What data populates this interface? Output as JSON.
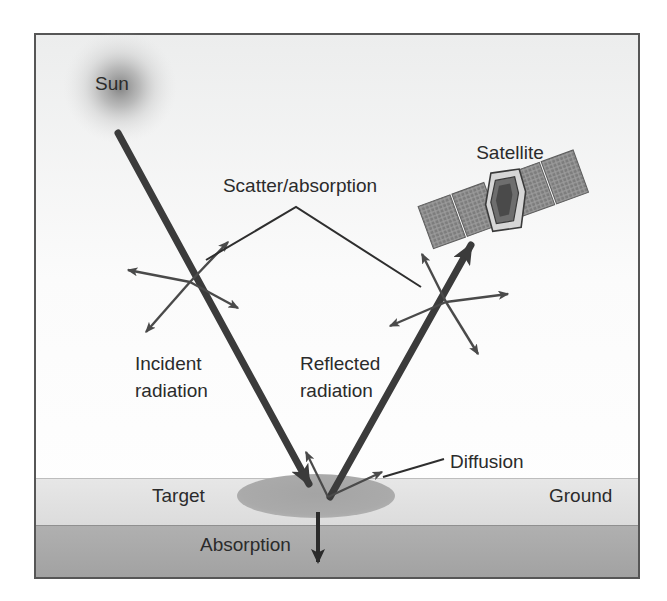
{
  "figure": {
    "type": "remote-sensing-radiation-path-diagram",
    "title_visible": false,
    "frame": {
      "x": 34,
      "y": 33,
      "width": 606,
      "height": 546,
      "border_color": "#555555",
      "border_width": 2
    },
    "background_color": "#f2f2f2",
    "sky_color": "#fbfbfb",
    "outer_page_color": "#ffffff"
  },
  "colors": {
    "ray_stroke": "#3b3b3b",
    "thin_arrow_stroke": "#4a4a4a",
    "leader_line": "#2e2e2e",
    "text": "#2b2b2b",
    "sun_glow": "#8c8c8c",
    "ground_surface_band": "#e2e2e2",
    "ground_subsurface_band": "#a9a9a9",
    "target_ellipse": "#a8a8a8",
    "satellite_panel": "#9a9a9a",
    "satellite_panel_dark": "#6f6f6f",
    "satellite_body": "#d8d8d8",
    "satellite_body_shadow": "#4f4f4f"
  },
  "labels": {
    "sun": {
      "text": "Sun",
      "x": 95,
      "y": 90,
      "font_size": 19,
      "anchor": "start"
    },
    "satellite": {
      "text": "Satellite",
      "x": 510,
      "y": 159,
      "font_size": 19,
      "anchor": "middle"
    },
    "scatter_absorption": {
      "text": "Scatter/absorption",
      "x": 300,
      "y": 192,
      "font_size": 19,
      "anchor": "middle"
    },
    "incident_radiation": {
      "lines": [
        "Incident",
        "radiation"
      ],
      "x": 135,
      "y": 370,
      "line_height": 27,
      "font_size": 19,
      "anchor": "start"
    },
    "reflected_radiation": {
      "lines": [
        "Reflected",
        "radiation"
      ],
      "x": 300,
      "y": 370,
      "line_height": 27,
      "font_size": 19,
      "anchor": "start"
    },
    "diffusion": {
      "text": "Diffusion",
      "x": 450,
      "y": 468,
      "font_size": 19,
      "anchor": "start"
    },
    "target": {
      "text": "Target",
      "x": 152,
      "y": 502,
      "font_size": 19,
      "anchor": "start"
    },
    "ground": {
      "text": "Ground",
      "x": 549,
      "y": 502,
      "font_size": 19,
      "anchor": "start"
    },
    "absorption": {
      "text": "Absorption",
      "x": 200,
      "y": 551,
      "font_size": 19,
      "anchor": "start"
    }
  },
  "geometry": {
    "sun_glow": {
      "cx": 120,
      "cy": 87,
      "r": 57
    },
    "ground_surface_band": {
      "x": 36,
      "y": 478,
      "width": 602,
      "height": 47
    },
    "ground_subsurface_band": {
      "x": 36,
      "y": 525,
      "width": 602,
      "height": 52
    },
    "target_ellipse": {
      "cx": 316,
      "cy": 496,
      "rx": 79,
      "ry": 22
    },
    "incident_ray": {
      "x1": 118,
      "y1": 133,
      "x2": 314,
      "y2": 492,
      "width": 7
    },
    "reflected_ray": {
      "x1": 330,
      "y1": 497,
      "x2": 478,
      "y2": 232,
      "width": 7
    },
    "absorption_arrow": {
      "x1": 318,
      "y1": 512,
      "x2": 318,
      "y2": 570,
      "width": 4
    },
    "scatter_point_left": {
      "x": 190,
      "y": 282
    },
    "scatter_point_right": {
      "x": 446,
      "y": 302
    },
    "diffusion_origin": {
      "x": 328,
      "y": 497
    },
    "leader_apex": {
      "x": 296,
      "y": 207
    },
    "leader_left_end": {
      "x": 206,
      "y": 260
    },
    "leader_right_end": {
      "x": 421,
      "y": 287
    },
    "diffusion_leader": {
      "x1": 444,
      "y1": 459,
      "x2": 382,
      "y2": 478
    },
    "satellite": {
      "cx": 503,
      "cy": 200,
      "rotation": -20
    }
  },
  "scatter_arrows_left": [
    {
      "name": "scatter-left-up-right",
      "dx": 38,
      "dy": -40
    },
    {
      "name": "scatter-left-left",
      "dx": -62,
      "dy": -12
    },
    {
      "name": "scatter-left-down-right",
      "dx": 48,
      "dy": 26
    },
    {
      "name": "scatter-left-down-left",
      "dx": -44,
      "dy": 50
    }
  ],
  "scatter_arrows_right": [
    {
      "name": "scatter-right-up-left",
      "dx": -24,
      "dy": -48
    },
    {
      "name": "scatter-right-right",
      "dx": 62,
      "dy": -8
    },
    {
      "name": "scatter-right-down-left",
      "dx": -56,
      "dy": 24
    },
    {
      "name": "scatter-right-down-right",
      "dx": 32,
      "dy": 52
    }
  ],
  "diffusion_arrows": [
    {
      "name": "diffusion-arrow-up-left",
      "dx": -24,
      "dy": -50
    },
    {
      "name": "diffusion-arrow-up-right",
      "dx": 60,
      "dy": -28
    }
  ],
  "satellite_parts": {
    "panels_left": 2,
    "panels_right": 2,
    "panel_grid_cols": 6,
    "panel_grid_rows": 5,
    "has_body": true
  }
}
